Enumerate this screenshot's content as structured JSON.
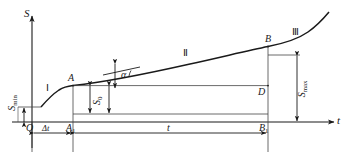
{
  "figure": {
    "axes": {
      "y_label": "S",
      "x_label": "t",
      "origin_label": "O"
    },
    "stage_labels": {
      "stage_1": "Ⅰ",
      "stage_2": "Ⅱ",
      "stage_3": "Ⅲ"
    },
    "points": {
      "A": "A",
      "B": "B",
      "D": "D",
      "A1_base": "A",
      "A1_sub": "1",
      "B1_base": "B",
      "B1_sub": "1"
    },
    "quantities": {
      "s_min_base": "S",
      "s_min_sub": "min",
      "s_max_base": "S",
      "s_max_sub": "max",
      "s0_base": "S",
      "s0_sub": "0",
      "delta_t": "Δt",
      "t_span": "t",
      "alpha": "α"
    },
    "colors": {
      "curve": "#1a1a1a",
      "axis": "#1a1a1a",
      "guide": "#555555",
      "background": "#ffffff"
    }
  }
}
